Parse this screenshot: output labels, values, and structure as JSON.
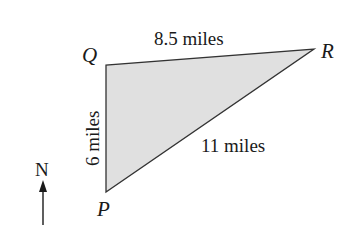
{
  "diagram": {
    "type": "triangle",
    "fill_color": "#e0e0e0",
    "stroke_color": "#333333",
    "vertices": [
      {
        "label": "P",
        "x": 106,
        "y": 192
      },
      {
        "label": "Q",
        "x": 106,
        "y": 65
      },
      {
        "label": "R",
        "x": 314,
        "y": 49
      }
    ],
    "sides": [
      {
        "from": "Q",
        "to": "R",
        "label": "8.5 miles"
      },
      {
        "from": "P",
        "to": "Q",
        "label": "6 miles"
      },
      {
        "from": "P",
        "to": "R",
        "label": "11 miles"
      }
    ],
    "compass": {
      "label": "N",
      "direction": "up"
    }
  }
}
